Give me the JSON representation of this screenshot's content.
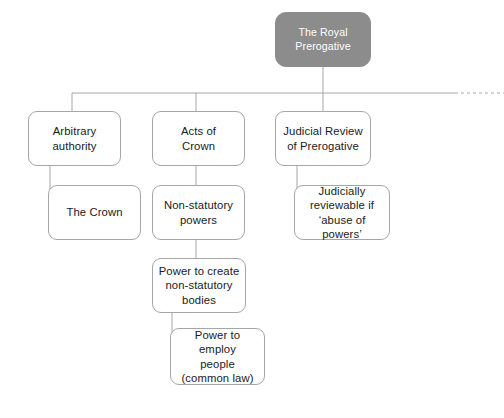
{
  "diagram": {
    "type": "tree-diagram",
    "colors": {
      "root_fill": "#8c8c8c",
      "root_text": "#ffffff",
      "node_fill": "#ffffff",
      "node_border": "#a6a6a6",
      "node_text": "#1a1a1a",
      "connector": "#a6a6a6",
      "background": "#ffffff"
    },
    "nodes": [
      {
        "id": "root",
        "label": "The Royal\nPrerogative",
        "style": "root",
        "x": 275,
        "y": 12,
        "w": 96,
        "h": 55
      },
      {
        "id": "arbitrary-authority",
        "label": "Arbitrary\nauthority",
        "style": "plain",
        "x": 28,
        "y": 111,
        "w": 93,
        "h": 55
      },
      {
        "id": "acts-of-crown",
        "label": "Acts of\nCrown",
        "style": "plain",
        "x": 152,
        "y": 111,
        "w": 93,
        "h": 55
      },
      {
        "id": "judicial-review-of-prerogative",
        "label": "Judicial Review\nof Prerogative",
        "style": "plain",
        "x": 275,
        "y": 111,
        "w": 96,
        "h": 55
      },
      {
        "id": "the-crown",
        "label": "The Crown",
        "style": "plain",
        "x": 48,
        "y": 185,
        "w": 93,
        "h": 55
      },
      {
        "id": "non-statutory-powers",
        "label": "Non-statutory\npowers",
        "style": "plain",
        "x": 152,
        "y": 185,
        "w": 93,
        "h": 55
      },
      {
        "id": "judicially-reviewable",
        "label": "Judicially\nreviewable if\n‘abuse of powers’",
        "style": "plain",
        "x": 294,
        "y": 185,
        "w": 96,
        "h": 55
      },
      {
        "id": "power-to-create-non-statutory-bodies",
        "label": "Power to create\nnon-statutory\nbodies",
        "style": "plain",
        "x": 152,
        "y": 258,
        "w": 94,
        "h": 55
      },
      {
        "id": "power-to-employ-people",
        "label": "Power to employ\npeople\n(common law)",
        "style": "plain",
        "x": 170,
        "y": 328,
        "w": 95,
        "h": 57
      }
    ],
    "connectors": [
      {
        "id": "root-to-bus",
        "from": "root",
        "to": "distribution-bus",
        "path": "M 323 67 L 323 93"
      },
      {
        "id": "distribution-bus",
        "from": "root",
        "to": "row-one",
        "path": "M 72 93 L 455 93"
      },
      {
        "id": "bus-fade",
        "from": "distribution-bus",
        "to": "offscreen-right",
        "path": "M 455 93 L 504 93",
        "dashed": true
      },
      {
        "id": "bus-to-arbitrary-authority",
        "from": "distribution-bus",
        "to": "arbitrary-authority",
        "path": "M 72 93 L 72 111"
      },
      {
        "id": "bus-to-acts-of-crown",
        "from": "distribution-bus",
        "to": "acts-of-crown",
        "path": "M 196 93 L 196 111"
      },
      {
        "id": "bus-to-judicial-review",
        "from": "distribution-bus",
        "to": "judicial-review-of-prerogative",
        "path": "M 323 93 L 323 111"
      },
      {
        "id": "arbitrary-authority-to-the-crown",
        "from": "arbitrary-authority",
        "to": "the-crown",
        "path": "M 50 166 L 50 212 L 48 212"
      },
      {
        "id": "acts-of-crown-to-non-statutory-powers",
        "from": "acts-of-crown",
        "to": "non-statutory-powers",
        "path": "M 196 166 L 196 185"
      },
      {
        "id": "judicial-review-to-judicially-reviewable",
        "from": "judicial-review-of-prerogative",
        "to": "judicially-reviewable",
        "path": "M 297 166 L 297 212 L 294 212"
      },
      {
        "id": "non-statutory-powers-to-power-to-create",
        "from": "non-statutory-powers",
        "to": "power-to-create-non-statutory-bodies",
        "path": "M 196 240 L 196 258"
      },
      {
        "id": "power-to-create-to-power-to-employ",
        "from": "power-to-create-non-statutory-bodies",
        "to": "power-to-employ-people",
        "path": "M 172 313 L 172 356 L 170 356"
      }
    ]
  }
}
